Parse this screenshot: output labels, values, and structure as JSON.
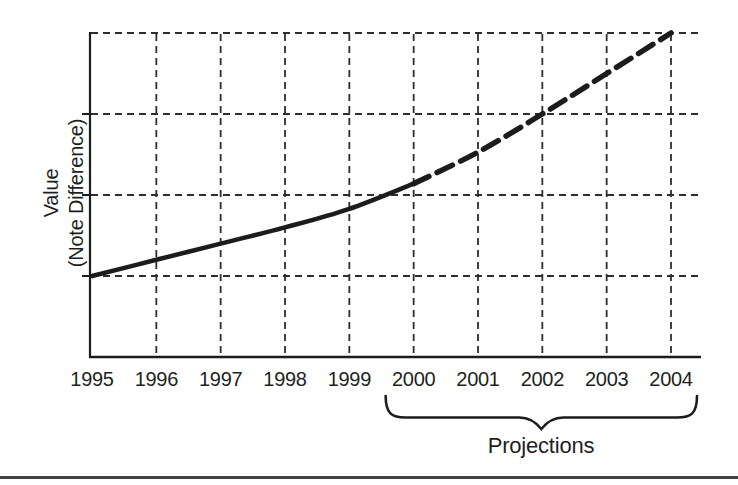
{
  "chart_text": {
    "y_label_line1": "Value",
    "y_label_line2": "(Note Difference)",
    "annotation_label": "Projections"
  },
  "chart_data": {
    "type": "line",
    "title": "",
    "xlabel": "",
    "ylabel": "Value (Note Difference)",
    "categories": [
      "1995",
      "1996",
      "1997",
      "1998",
      "1999",
      "2000",
      "2001",
      "2002",
      "2003",
      "2004"
    ],
    "x": [
      1995,
      1996,
      1997,
      1998,
      1999,
      2000,
      2001,
      2002,
      2003,
      2004
    ],
    "series": [
      {
        "name": "Historical value",
        "style": "solid",
        "x": [
          1995,
          1996,
          1997,
          1998,
          1999,
          2000
        ],
        "values": [
          1.0,
          1.2,
          1.4,
          1.6,
          1.83,
          2.14
        ]
      },
      {
        "name": "Projections",
        "style": "dashed",
        "x": [
          2000,
          2001,
          2002,
          2003,
          2004
        ],
        "values": [
          2.14,
          2.53,
          3.0,
          3.5,
          4.0
        ]
      }
    ],
    "xlim": [
      1995,
      2004
    ],
    "ylim": [
      0,
      4
    ],
    "y_tick_labels": [],
    "y_gridlines": [
      1,
      2,
      3,
      4
    ],
    "x_gridlines": [
      1996,
      1997,
      1998,
      1999,
      2000,
      2001,
      2002,
      2003,
      2004
    ],
    "grid": "dashed",
    "legend": "none",
    "annotation": {
      "label": "Projections",
      "span_years": [
        2000,
        2004
      ]
    }
  },
  "colors": {
    "ink": "#1c1c1c",
    "grid": "#2e2e2e",
    "text": "#1f1f1f",
    "background": "#ffffff",
    "bottom_rule": "#424242"
  }
}
